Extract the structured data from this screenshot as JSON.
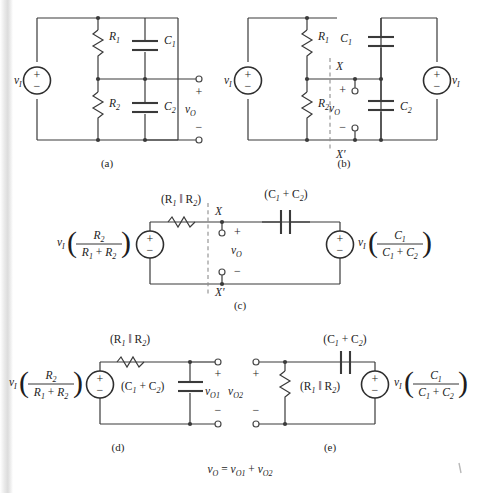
{
  "figure": {
    "type": "circuit-diagram-set",
    "caption_equation": "v_O = v_O1 + v_O2",
    "symbols": {
      "vi": "v",
      "vi_sub": "I",
      "vo": "v",
      "vo_sub": "O",
      "vo1_sub": "O1",
      "vo2_sub": "O2",
      "R1": "R",
      "R1_sub": "1",
      "R2": "R",
      "R2_sub": "2",
      "C1": "C",
      "C1_sub": "1",
      "C2": "C",
      "C2_sub": "2",
      "plus": "+",
      "minus": "−",
      "parallel": "‖",
      "X": "X",
      "Xprime": "X′"
    },
    "panels": [
      {
        "id": "a",
        "label": "(a)",
        "title": "Original divider network",
        "components": [
          "v_I source",
          "R1",
          "R2",
          "C1",
          "C2"
        ],
        "output_label": "v_O",
        "terminal_plus": "+",
        "terminal_minus": "−"
      },
      {
        "id": "b",
        "label": "(b)",
        "title": "Split-source equivalent with cut X-X'",
        "components": [
          "v_I source (left)",
          "R1",
          "R2",
          "C1",
          "C2",
          "v_I source (right)"
        ],
        "cut_top": "X",
        "cut_bottom": "X′",
        "output_label": "v_O",
        "terminal_plus": "+",
        "terminal_minus": "−"
      },
      {
        "id": "c",
        "label": "(c)",
        "title": "Thevenin equivalents on both sides",
        "left_source_expr": {
          "prefix": "v",
          "prefix_sub": "I",
          "numerator": "R",
          "numerator_sub": "2",
          "denominator_a": "R",
          "denominator_a_sub": "1",
          "denominator_op": "+",
          "denominator_b": "R",
          "denominator_b_sub": "2"
        },
        "series_resistor": "(R1 ‖ R2)",
        "series_capacitor": "(C1 + C2)",
        "right_source_expr": {
          "prefix": "v",
          "prefix_sub": "I",
          "numerator": "C",
          "numerator_sub": "1",
          "denominator_a": "C",
          "denominator_a_sub": "1",
          "denominator_op": "+",
          "denominator_b": "C",
          "denominator_b_sub": "2"
        },
        "cut_top": "X",
        "cut_bottom": "X′",
        "output_label": "v_O",
        "terminal_plus": "+",
        "terminal_minus": "−"
      },
      {
        "id": "d",
        "label": "(d)",
        "title": "Superposition: resistive source alone",
        "source_expr": {
          "prefix": "v",
          "prefix_sub": "I",
          "numerator": "R",
          "numerator_sub": "2",
          "denominator_a": "R",
          "denominator_a_sub": "1",
          "denominator_op": "+",
          "denominator_b": "R",
          "denominator_b_sub": "2"
        },
        "series_resistor": "(R1 ‖ R2)",
        "shunt_capacitor": "(C1 + C2)",
        "output_label": "v_O1",
        "terminal_plus": "+",
        "terminal_minus": "−"
      },
      {
        "id": "e",
        "label": "(e)",
        "title": "Superposition: capacitive source alone",
        "series_capacitor": "(C1 + C2)",
        "shunt_resistor": "(R1 ‖ R2)",
        "source_expr": {
          "prefix": "v",
          "prefix_sub": "I",
          "numerator": "C",
          "numerator_sub": "1",
          "denominator_a": "C",
          "denominator_a_sub": "1",
          "denominator_op": "+",
          "denominator_b": "C",
          "denominator_b_sub": "2"
        },
        "output_label": "v_O2",
        "terminal_plus": "+",
        "terminal_minus": "−"
      }
    ]
  }
}
